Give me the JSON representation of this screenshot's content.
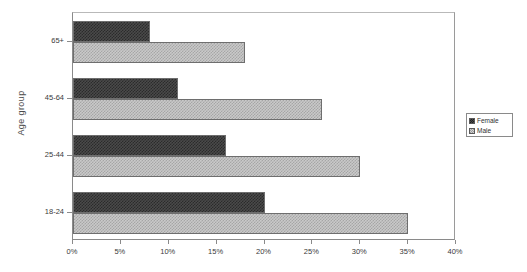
{
  "chart_data": {
    "type": "bar",
    "orientation": "horizontal",
    "title": "",
    "xlabel": "",
    "ylabel": "Age group",
    "categories": [
      "65+",
      "45-64",
      "25-44",
      "18-24"
    ],
    "series": [
      {
        "name": "Female",
        "values": [
          8,
          11,
          16,
          20
        ],
        "color": "#4a4a4a",
        "pattern": "checker-dark"
      },
      {
        "name": "Male",
        "values": [
          18,
          26,
          30,
          35
        ],
        "color": "#c9c9c9",
        "pattern": "checker-light"
      }
    ],
    "xlim": [
      0,
      40
    ],
    "xtick_values": [
      0,
      5,
      10,
      15,
      20,
      25,
      30,
      35,
      40
    ],
    "xtick_labels": [
      "0%",
      "5%",
      "10%",
      "15%",
      "20%",
      "25%",
      "30%",
      "35%",
      "40%"
    ],
    "grid": false,
    "legend_position": "right",
    "value_suffix": "%"
  },
  "legend": {
    "items": [
      {
        "label": "Female",
        "swatch": "female"
      },
      {
        "label": "Male",
        "swatch": "male"
      }
    ]
  },
  "axes": {
    "y_title": "Age group"
  }
}
